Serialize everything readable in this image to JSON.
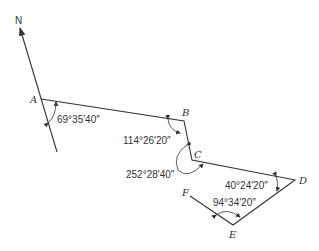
{
  "diagram": {
    "type": "traverse-survey",
    "north_label": "N",
    "points": [
      {
        "id": "A",
        "label": "A",
        "x": 41,
        "y": 99
      },
      {
        "id": "B",
        "label": "B",
        "x": 184,
        "y": 121
      },
      {
        "id": "C",
        "label": "C",
        "x": 192,
        "y": 160
      },
      {
        "id": "D",
        "label": "D",
        "x": 295,
        "y": 180
      },
      {
        "id": "E",
        "label": "E",
        "x": 233,
        "y": 225
      },
      {
        "id": "F",
        "label": "F",
        "x": 190,
        "y": 196
      }
    ],
    "angles": [
      {
        "at": "A",
        "label": "69°35′40″",
        "desc": "north to AB"
      },
      {
        "at": "B",
        "label": "114°26′20″"
      },
      {
        "at": "C",
        "label": "252°28′40″"
      },
      {
        "at": "D",
        "label": "40°24′20″"
      },
      {
        "at": "E",
        "label": "94°34′20″"
      }
    ],
    "colors": {
      "line": "#333333",
      "background": "#ffffff"
    }
  }
}
